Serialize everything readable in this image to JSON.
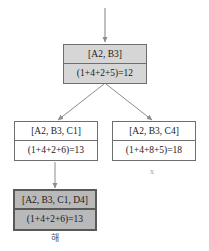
{
  "diagram": {
    "type": "search-tree",
    "title": "",
    "nodes": [
      {
        "id": "root",
        "state": "[A2, B3]",
        "cost": "(1+4+2+5)=12",
        "shaded": "light"
      },
      {
        "id": "left",
        "state": "[A2, B3, C1]",
        "cost": "(1+4+2+6)=13",
        "shaded": "none"
      },
      {
        "id": "right",
        "state": "[A2, B3, C4]",
        "cost": "(1+4+8+5)=18",
        "shaded": "none"
      },
      {
        "id": "goal",
        "state": "[A2, B3, C1, D4]",
        "cost": "(1+4+2+6)=13",
        "shaded": "dark"
      }
    ],
    "annotations": {
      "pruned_mark": "x",
      "solution_label": "해"
    },
    "colors": {
      "border": "#6e6e6e",
      "goal_border": "#595959",
      "shade_light": "#d6d6d6",
      "shade_dark": "#b9b9b9",
      "edge": "#8c8c8c",
      "text": "#1a1a1a",
      "caption": "#555555"
    }
  }
}
